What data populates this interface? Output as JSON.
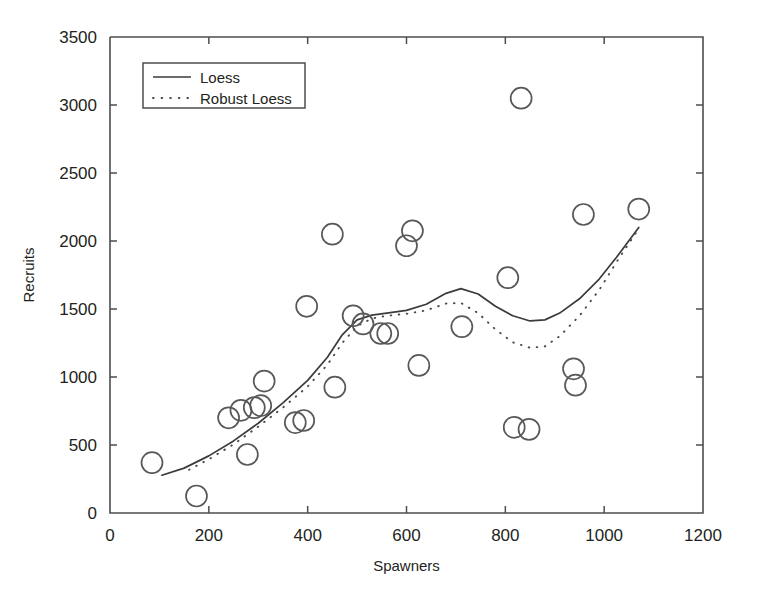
{
  "chart_data": {
    "type": "scatter",
    "title": "",
    "xlabel": "Spawners",
    "ylabel": "Recruits",
    "xlim": [
      0,
      1200
    ],
    "ylim": [
      0,
      3500
    ],
    "xticks": [
      0,
      200,
      400,
      600,
      800,
      1000,
      1200
    ],
    "yticks": [
      0,
      500,
      1000,
      1500,
      2000,
      2500,
      3000,
      3500
    ],
    "xtick_labels": [
      "0",
      "200",
      "400",
      "600",
      "800",
      "1000",
      "1200"
    ],
    "ytick_labels": [
      "0",
      "500",
      "1000",
      "1500",
      "2000",
      "2500",
      "3000",
      "3500"
    ],
    "grid": false,
    "legend_position": "upper left",
    "marker": "open-circle",
    "points": [
      {
        "x": 85,
        "y": 370
      },
      {
        "x": 175,
        "y": 125
      },
      {
        "x": 240,
        "y": 700
      },
      {
        "x": 265,
        "y": 755
      },
      {
        "x": 278,
        "y": 430
      },
      {
        "x": 292,
        "y": 775
      },
      {
        "x": 305,
        "y": 790
      },
      {
        "x": 312,
        "y": 970
      },
      {
        "x": 375,
        "y": 665
      },
      {
        "x": 392,
        "y": 680
      },
      {
        "x": 398,
        "y": 1520
      },
      {
        "x": 450,
        "y": 2050
      },
      {
        "x": 455,
        "y": 925
      },
      {
        "x": 492,
        "y": 1450
      },
      {
        "x": 512,
        "y": 1390
      },
      {
        "x": 548,
        "y": 1320
      },
      {
        "x": 562,
        "y": 1320
      },
      {
        "x": 600,
        "y": 1965
      },
      {
        "x": 612,
        "y": 2075
      },
      {
        "x": 625,
        "y": 1085
      },
      {
        "x": 712,
        "y": 1370
      },
      {
        "x": 805,
        "y": 1730
      },
      {
        "x": 818,
        "y": 630
      },
      {
        "x": 832,
        "y": 3050
      },
      {
        "x": 848,
        "y": 615
      },
      {
        "x": 938,
        "y": 1060
      },
      {
        "x": 942,
        "y": 940
      },
      {
        "x": 958,
        "y": 2195
      },
      {
        "x": 1070,
        "y": 2235
      }
    ],
    "series": [
      {
        "name": "Loess",
        "style": "solid",
        "points": [
          {
            "x": 105,
            "y": 278
          },
          {
            "x": 150,
            "y": 330
          },
          {
            "x": 200,
            "y": 420
          },
          {
            "x": 250,
            "y": 530
          },
          {
            "x": 300,
            "y": 660
          },
          {
            "x": 350,
            "y": 810
          },
          {
            "x": 400,
            "y": 975
          },
          {
            "x": 440,
            "y": 1145
          },
          {
            "x": 470,
            "y": 1310
          },
          {
            "x": 500,
            "y": 1420
          },
          {
            "x": 530,
            "y": 1455
          },
          {
            "x": 560,
            "y": 1470
          },
          {
            "x": 600,
            "y": 1490
          },
          {
            "x": 640,
            "y": 1535
          },
          {
            "x": 680,
            "y": 1615
          },
          {
            "x": 710,
            "y": 1650
          },
          {
            "x": 745,
            "y": 1610
          },
          {
            "x": 780,
            "y": 1520
          },
          {
            "x": 815,
            "y": 1450
          },
          {
            "x": 850,
            "y": 1412
          },
          {
            "x": 880,
            "y": 1420
          },
          {
            "x": 910,
            "y": 1470
          },
          {
            "x": 950,
            "y": 1575
          },
          {
            "x": 990,
            "y": 1720
          },
          {
            "x": 1025,
            "y": 1880
          },
          {
            "x": 1070,
            "y": 2100
          }
        ]
      },
      {
        "name": "Robust Loess",
        "style": "dotted",
        "points": [
          {
            "x": 160,
            "y": 318
          },
          {
            "x": 200,
            "y": 395
          },
          {
            "x": 250,
            "y": 505
          },
          {
            "x": 300,
            "y": 635
          },
          {
            "x": 350,
            "y": 775
          },
          {
            "x": 400,
            "y": 930
          },
          {
            "x": 440,
            "y": 1090
          },
          {
            "x": 470,
            "y": 1250
          },
          {
            "x": 500,
            "y": 1375
          },
          {
            "x": 530,
            "y": 1430
          },
          {
            "x": 560,
            "y": 1450
          },
          {
            "x": 600,
            "y": 1465
          },
          {
            "x": 640,
            "y": 1490
          },
          {
            "x": 680,
            "y": 1540
          },
          {
            "x": 710,
            "y": 1545
          },
          {
            "x": 745,
            "y": 1470
          },
          {
            "x": 780,
            "y": 1350
          },
          {
            "x": 815,
            "y": 1255
          },
          {
            "x": 850,
            "y": 1215
          },
          {
            "x": 880,
            "y": 1225
          },
          {
            "x": 910,
            "y": 1300
          },
          {
            "x": 950,
            "y": 1450
          },
          {
            "x": 990,
            "y": 1640
          },
          {
            "x": 1025,
            "y": 1845
          },
          {
            "x": 1070,
            "y": 2090
          }
        ]
      }
    ],
    "legend": [
      {
        "label": "Loess",
        "style": "solid"
      },
      {
        "label": "Robust Loess",
        "style": "dotted"
      }
    ]
  }
}
